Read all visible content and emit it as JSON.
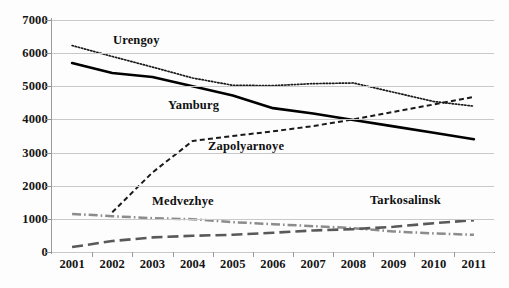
{
  "chart_data": {
    "type": "line",
    "title": "",
    "subtitle": "",
    "xlabel": "",
    "ylabel": "",
    "categories": [
      "2001",
      "2002",
      "2003",
      "2004",
      "2005",
      "2006",
      "2007",
      "2008",
      "2009",
      "2010",
      "2011"
    ],
    "ylim": [
      0,
      7000
    ],
    "ytick_labels": [
      "0",
      "1000",
      "2000",
      "3000",
      "4000",
      "5000",
      "6000",
      "7000"
    ],
    "ytick_values": [
      0,
      1000,
      2000,
      3000,
      4000,
      5000,
      6000,
      7000
    ],
    "grid": true,
    "legend_position": "inline-annotations",
    "series": [
      {
        "name": "Urengoy",
        "style": "dotted",
        "color": "#1a1a1a",
        "values": [
          6230,
          5900,
          5580,
          5250,
          5030,
          5020,
          5080,
          5100,
          4820,
          4540,
          4400
        ]
      },
      {
        "name": "Yamburg",
        "style": "solid",
        "color": "#000000",
        "values": [
          5700,
          5400,
          5280,
          5000,
          4720,
          4340,
          4180,
          3980,
          3790,
          3600,
          3400
        ]
      },
      {
        "name": "Zapolyarnoye",
        "style": "dashed",
        "color": "#1a1a1a",
        "values": [
          null,
          1200,
          2400,
          3350,
          3500,
          3640,
          3800,
          4000,
          4230,
          4450,
          4680
        ]
      },
      {
        "name": "Medvezhye",
        "style": "dash-dot",
        "color": "#8c8c8c",
        "values": [
          1150,
          1080,
          1020,
          990,
          900,
          840,
          780,
          720,
          620,
          560,
          520
        ]
      },
      {
        "name": "Tarkosalinsk",
        "style": "long-dash",
        "color": "#595959",
        "values": [
          150,
          330,
          440,
          490,
          520,
          580,
          650,
          690,
          760,
          870,
          960
        ]
      }
    ],
    "annotations": [
      {
        "text": "Urengoy",
        "series": "Urengoy"
      },
      {
        "text": "Yamburg",
        "series": "Yamburg"
      },
      {
        "text": "Zapolyarnoye",
        "series": "Zapolyarnoye"
      },
      {
        "text": "Medvezhye",
        "series": "Medvezhye"
      },
      {
        "text": "Tarkosalinsk",
        "series": "Tarkosalinsk"
      }
    ]
  },
  "caption": ""
}
